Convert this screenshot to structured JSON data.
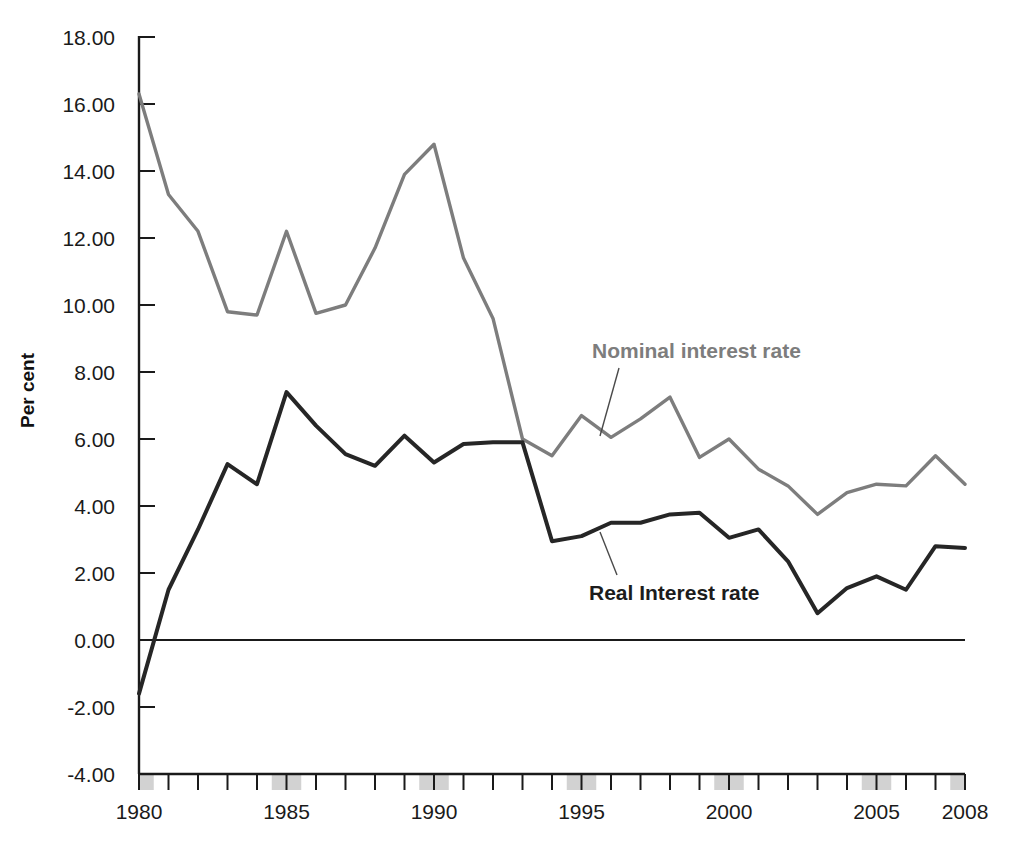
{
  "chart_data": {
    "type": "line",
    "title": "",
    "xlabel": "",
    "ylabel": "Per cent",
    "xlim": [
      1979.5,
      2008.5
    ],
    "ylim": [
      -4.0,
      18.0
    ],
    "ytick_step": 2.0,
    "grid": false,
    "legend_position": "inline-annotations",
    "ytick_labels": [
      "18.00",
      "16.00",
      "14.00",
      "12.00",
      "10.00",
      "8.00",
      "6.00",
      "4.00",
      "2.00",
      "0.00",
      "-2.00",
      "-4.00"
    ],
    "ytick_values": [
      18,
      16,
      14,
      12,
      10,
      8,
      6,
      4,
      2,
      0,
      -2,
      -4
    ],
    "xtick_labels": [
      "1980",
      "1985",
      "1990",
      "1995",
      "2000",
      "2005",
      "2008"
    ],
    "xtick_values": [
      1980,
      1985,
      1990,
      1995,
      2000,
      2005,
      2008
    ],
    "shaded_year_bands": [
      1980,
      1985,
      1990,
      1995,
      2000,
      2005,
      2008
    ],
    "x": [
      1980,
      1981,
      1982,
      1983,
      1984,
      1985,
      1986,
      1987,
      1988,
      1989,
      1990,
      1991,
      1992,
      1993,
      1994,
      1995,
      1996,
      1997,
      1998,
      1999,
      2000,
      2001,
      2002,
      2003,
      2004,
      2005,
      2006,
      2007,
      2008
    ],
    "series": [
      {
        "name": "Nominal interest rate",
        "color": "#7d7d7d",
        "values": [
          16.3,
          13.3,
          12.2,
          9.8,
          9.7,
          12.2,
          9.75,
          10.0,
          11.7,
          13.9,
          14.8,
          11.4,
          9.6,
          6.0,
          5.5,
          6.7,
          6.05,
          6.6,
          7.25,
          5.45,
          6.0,
          5.1,
          4.6,
          3.75,
          4.4,
          4.65,
          4.6,
          5.5,
          4.65
        ]
      },
      {
        "name": "Real Interest rate",
        "color": "#262626",
        "values": [
          -1.6,
          1.5,
          3.3,
          5.25,
          4.65,
          7.4,
          6.4,
          5.55,
          5.2,
          6.1,
          5.3,
          5.85,
          5.9,
          5.9,
          2.95,
          3.1,
          3.5,
          3.5,
          3.75,
          3.8,
          3.05,
          3.3,
          2.35,
          0.8,
          1.55,
          1.9,
          1.5,
          2.8,
          2.75
        ]
      }
    ],
    "annotations": [
      {
        "text": "Nominal interest rate",
        "series": "Nominal interest rate"
      },
      {
        "text": "Real Interest rate",
        "series": "Real Interest rate"
      }
    ]
  },
  "axis": {
    "y_axis_title": "Per cent"
  }
}
